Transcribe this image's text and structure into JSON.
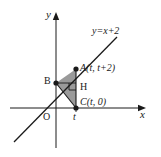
{
  "figure": {
    "kind": "coordinate-geometry-diagram",
    "axes": {
      "y_axis_label": "y",
      "x_axis_label": "x",
      "origin_label": "O",
      "x_tick_label": "t"
    },
    "line": {
      "equation_label": "y=x+2"
    },
    "points": {
      "a_label": "A(t, t+2)",
      "b_label": "B",
      "h_label": "H",
      "c_label": "C(t, 0)"
    },
    "colors": {
      "stroke": "#1a1a1a",
      "shade_fill": "#9a9a9a",
      "background": "#ffffff"
    }
  }
}
